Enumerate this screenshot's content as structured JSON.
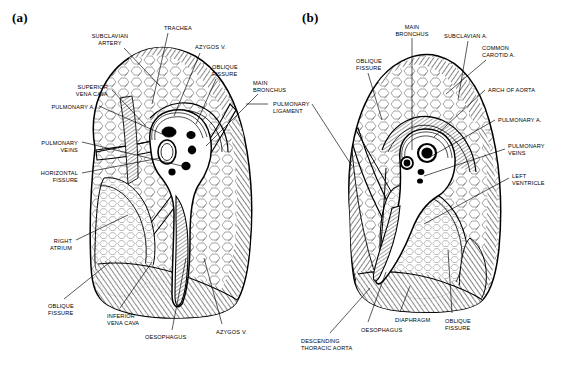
{
  "figure": {
    "background_color": "#ffffff",
    "ink_color": "#000000",
    "panels": [
      {
        "id": "a",
        "letter": "(a)",
        "subject": "right lung, mediastinal surface"
      },
      {
        "id": "b",
        "letter": "(b)",
        "subject": "left lung, mediastinal surface"
      }
    ]
  },
  "labels_a": [
    {
      "name": "subclavian-artery",
      "text": "SUBCLAVIAN\nARTERY",
      "x": 110,
      "y": 33,
      "align": "c"
    },
    {
      "name": "trachea",
      "text": "TRACHEA",
      "x": 164,
      "y": 25,
      "align": "l"
    },
    {
      "name": "azygos-vein-top",
      "text": "AZYGOS V.",
      "x": 195,
      "y": 44,
      "align": "l"
    },
    {
      "name": "oblique-fissure-top",
      "text": "OBLIQUE\nFISSURE",
      "x": 212,
      "y": 64,
      "align": "l"
    },
    {
      "name": "main-bronchus",
      "text": "MAIN\nBRONCHUS",
      "x": 253,
      "y": 80,
      "align": "l"
    },
    {
      "name": "superior-vena-cava",
      "text": "SUPERIOR\nVENA CAVA",
      "x": 108,
      "y": 84,
      "align": "r"
    },
    {
      "name": "pulmonary-artery",
      "text": "PULMONARY A.",
      "x": 95,
      "y": 104,
      "align": "r"
    },
    {
      "name": "pulmonary-veins",
      "text": "PULMONARY\nVEINS",
      "x": 78,
      "y": 140,
      "align": "r"
    },
    {
      "name": "horizontal-fissure",
      "text": "HORIZONTAL\nFISSURE",
      "x": 78,
      "y": 170,
      "align": "r"
    },
    {
      "name": "right-atrium",
      "text": "RIGHT\nATRIUM",
      "x": 72,
      "y": 238,
      "align": "r"
    },
    {
      "name": "oblique-fissure-bot",
      "text": "OBLIQUE\nFISSURE",
      "x": 48,
      "y": 303,
      "align": "l"
    },
    {
      "name": "inferior-vena-cava",
      "text": "INFERIOR\nVENA CAVA",
      "x": 107,
      "y": 313,
      "align": "l"
    },
    {
      "name": "oesophagus",
      "text": "OESOPHAGUS",
      "x": 145,
      "y": 334,
      "align": "l"
    },
    {
      "name": "azygos-vein-bottom",
      "text": "AZYGOS V.",
      "x": 216,
      "y": 329,
      "align": "l"
    }
  ],
  "labels_shared": [
    {
      "name": "pulmonary-ligament",
      "text": "PULMONARY\nLIGAMENT",
      "x": 273,
      "y": 101,
      "align": "l"
    }
  ],
  "labels_b": [
    {
      "name": "main-bronchus",
      "text": "MAIN\nBRONCHUS",
      "x": 412,
      "y": 24,
      "align": "c"
    },
    {
      "name": "subclavian-artery",
      "text": "SUBCLAVIAN A.",
      "x": 444,
      "y": 33,
      "align": "l"
    },
    {
      "name": "common-carotid-artery",
      "text": "COMMON\nCAROTID A.",
      "x": 482,
      "y": 45,
      "align": "l"
    },
    {
      "name": "oblique-fissure-top",
      "text": "OBLIQUE\nFISSURE",
      "x": 356,
      "y": 58,
      "align": "l"
    },
    {
      "name": "arch-of-aorta",
      "text": "ARCH OF AORTA",
      "x": 488,
      "y": 87,
      "align": "l"
    },
    {
      "name": "pulmonary-artery",
      "text": "PULMONARY A.",
      "x": 498,
      "y": 117,
      "align": "l"
    },
    {
      "name": "pulmonary-veins",
      "text": "PULMONARY\nVEINS",
      "x": 508,
      "y": 143,
      "align": "l"
    },
    {
      "name": "left-ventricle",
      "text": "LEFT\nVENTRICLE",
      "x": 512,
      "y": 173,
      "align": "l"
    },
    {
      "name": "descending-thoracic-aorta",
      "text": "DESCENDING\nTHORACIC AORTA",
      "x": 301,
      "y": 338,
      "align": "l"
    },
    {
      "name": "oesophagus",
      "text": "OESOPHAGUS",
      "x": 361,
      "y": 327,
      "align": "l"
    },
    {
      "name": "diaphragm",
      "text": "DIAPHRAGM",
      "x": 395,
      "y": 317,
      "align": "l"
    },
    {
      "name": "oblique-fissure-bot",
      "text": "OBLIQUE\nFISSURE",
      "x": 445,
      "y": 318,
      "align": "l"
    }
  ]
}
